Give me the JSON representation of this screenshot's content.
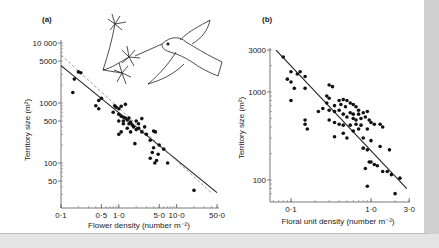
{
  "chart_data": [
    {
      "panel_label": "(a)",
      "type": "scatter",
      "xscale": "log",
      "yscale": "log",
      "xlabel": "Flower density (number m⁻²)",
      "ylabel": "Territory size (m²)",
      "xticks": [
        "0·1",
        "0·5",
        "1·0",
        "5·0",
        "10·0",
        "50·0"
      ],
      "xtick_values": [
        0.1,
        0.5,
        1.0,
        5.0,
        10.0,
        50.0
      ],
      "yticks": [
        "10 000",
        "5000",
        "1000",
        "500",
        "100",
        "50"
      ],
      "ytick_values": [
        10000,
        5000,
        1000,
        500,
        100,
        50
      ],
      "xlim": [
        0.1,
        50
      ],
      "ylim": [
        30,
        10000
      ],
      "grid": false,
      "illustration": "hummingbird feeding at flowers",
      "lines": [
        {
          "name": "regression (solid)",
          "style": "solid",
          "x": [
            0.1,
            50
          ],
          "y": [
            4200,
            32
          ]
        },
        {
          "name": "predicted (dashed)",
          "style": "dashed",
          "x": [
            0.1,
            40
          ],
          "y": [
            6300,
            32
          ]
        }
      ],
      "points": [
        [
          0.2,
          3300
        ],
        [
          0.22,
          3200
        ],
        [
          0.17,
          2500
        ],
        [
          0.16,
          1500
        ],
        [
          0.45,
          1100
        ],
        [
          0.5,
          1200
        ],
        [
          0.4,
          900
        ],
        [
          0.45,
          800
        ],
        [
          0.85,
          900
        ],
        [
          0.9,
          850
        ],
        [
          1.0,
          800
        ],
        [
          1.1,
          880
        ],
        [
          1.3,
          950
        ],
        [
          0.8,
          700
        ],
        [
          1.0,
          650
        ],
        [
          1.1,
          600
        ],
        [
          1.2,
          580
        ],
        [
          1.3,
          560
        ],
        [
          1.0,
          500
        ],
        [
          1.2,
          500
        ],
        [
          1.5,
          560
        ],
        [
          1.4,
          520
        ],
        [
          1.6,
          480
        ],
        [
          1.5,
          450
        ],
        [
          1.7,
          430
        ],
        [
          1.2,
          450
        ],
        [
          2.0,
          500
        ],
        [
          2.2,
          450
        ],
        [
          2.5,
          550
        ],
        [
          1.8,
          400
        ],
        [
          2.2,
          380
        ],
        [
          2.0,
          360
        ],
        [
          1.4,
          380
        ],
        [
          1.6,
          330
        ],
        [
          1.1,
          330
        ],
        [
          2.5,
          330
        ],
        [
          2.8,
          400
        ],
        [
          3.0,
          300
        ],
        [
          1.0,
          300
        ],
        [
          1.9,
          210
        ],
        [
          3.5,
          240
        ],
        [
          4.0,
          340
        ],
        [
          4.3,
          330
        ],
        [
          5.0,
          200
        ],
        [
          4.0,
          180
        ],
        [
          3.8,
          150
        ],
        [
          4.8,
          140
        ],
        [
          3.5,
          120
        ],
        [
          4.5,
          110
        ],
        [
          6.0,
          170
        ],
        [
          4.2,
          100
        ],
        [
          7.0,
          100
        ],
        [
          20,
          35
        ]
      ]
    },
    {
      "panel_label": "(b)",
      "type": "scatter",
      "xscale": "log",
      "yscale": "log",
      "xlabel": "Floral unit density (number m⁻²)",
      "ylabel": "Territory size (m²)",
      "xticks": [
        "0·1",
        "1·0",
        "3·0"
      ],
      "xtick_values": [
        0.1,
        1.0,
        3.0
      ],
      "yticks": [
        "3000",
        "1000",
        "100"
      ],
      "ytick_values": [
        3000,
        1000,
        100
      ],
      "xlim": [
        0.055,
        3.0
      ],
      "ylim": [
        70,
        3000
      ],
      "grid": false,
      "lines": [
        {
          "name": "regression (solid)",
          "style": "solid",
          "x": [
            0.065,
            2.8
          ],
          "y": [
            3000,
            80
          ]
        }
      ],
      "points": [
        [
          0.08,
          2500
        ],
        [
          0.1,
          1700
        ],
        [
          0.12,
          1600
        ],
        [
          0.13,
          1700
        ],
        [
          0.15,
          1500
        ],
        [
          0.09,
          1400
        ],
        [
          0.1,
          1300
        ],
        [
          0.11,
          1100
        ],
        [
          0.15,
          1100
        ],
        [
          0.1,
          800
        ],
        [
          0.3,
          1200
        ],
        [
          0.33,
          1150
        ],
        [
          0.28,
          900
        ],
        [
          0.3,
          850
        ],
        [
          0.28,
          750
        ],
        [
          0.35,
          700
        ],
        [
          0.4,
          800
        ],
        [
          0.45,
          820
        ],
        [
          0.5,
          800
        ],
        [
          0.42,
          720
        ],
        [
          0.48,
          680
        ],
        [
          0.55,
          750
        ],
        [
          0.6,
          720
        ],
        [
          0.65,
          680
        ],
        [
          0.7,
          620
        ],
        [
          0.25,
          650
        ],
        [
          0.3,
          620
        ],
        [
          0.22,
          600
        ],
        [
          0.35,
          600
        ],
        [
          0.4,
          620
        ],
        [
          0.45,
          560
        ],
        [
          0.55,
          580
        ],
        [
          0.6,
          560
        ],
        [
          0.7,
          560
        ],
        [
          0.8,
          580
        ],
        [
          0.9,
          600
        ],
        [
          0.5,
          520
        ],
        [
          0.6,
          500
        ],
        [
          0.65,
          480
        ],
        [
          0.75,
          500
        ],
        [
          0.85,
          520
        ],
        [
          0.95,
          480
        ],
        [
          0.15,
          480
        ],
        [
          0.15,
          430
        ],
        [
          0.16,
          380
        ],
        [
          0.3,
          480
        ],
        [
          0.35,
          450
        ],
        [
          0.4,
          430
        ],
        [
          0.45,
          420
        ],
        [
          0.55,
          420
        ],
        [
          0.65,
          430
        ],
        [
          0.75,
          420
        ],
        [
          1.0,
          450
        ],
        [
          1.1,
          430
        ],
        [
          1.3,
          430
        ],
        [
          1.4,
          400
        ],
        [
          0.9,
          380
        ],
        [
          0.7,
          380
        ],
        [
          0.6,
          360
        ],
        [
          0.45,
          340
        ],
        [
          0.35,
          310
        ],
        [
          0.5,
          300
        ],
        [
          0.8,
          300
        ],
        [
          1.0,
          280
        ],
        [
          1.3,
          240
        ],
        [
          0.8,
          230
        ],
        [
          0.9,
          220
        ],
        [
          1.7,
          220
        ],
        [
          0.95,
          160
        ],
        [
          1.0,
          160
        ],
        [
          1.1,
          150
        ],
        [
          1.2,
          145
        ],
        [
          1.4,
          125
        ],
        [
          1.6,
          125
        ],
        [
          0.85,
          135
        ],
        [
          1.8,
          115
        ],
        [
          2.3,
          105
        ],
        [
          0.9,
          85
        ],
        [
          2.0,
          70
        ]
      ]
    }
  ]
}
